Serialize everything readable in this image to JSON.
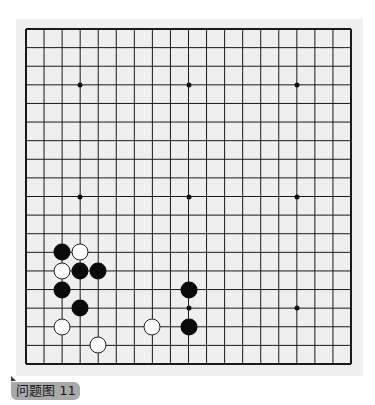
{
  "board": {
    "size": 19,
    "colors": {
      "line": "#1a1a1a",
      "background": "#efefef",
      "black": "#0a0a0a",
      "white": "#ffffff"
    },
    "star_points": [
      [
        3,
        3
      ],
      [
        9,
        3
      ],
      [
        15,
        3
      ],
      [
        3,
        9
      ],
      [
        9,
        9
      ],
      [
        15,
        9
      ],
      [
        3,
        15
      ],
      [
        9,
        15
      ],
      [
        15,
        15
      ]
    ],
    "stones": [
      {
        "color": "black",
        "col": 2,
        "row": 12
      },
      {
        "color": "white",
        "col": 3,
        "row": 12
      },
      {
        "color": "white",
        "col": 2,
        "row": 13
      },
      {
        "color": "black",
        "col": 3,
        "row": 13
      },
      {
        "color": "black",
        "col": 4,
        "row": 13
      },
      {
        "color": "black",
        "col": 2,
        "row": 14
      },
      {
        "color": "black",
        "col": 3,
        "row": 15
      },
      {
        "color": "white",
        "col": 2,
        "row": 16
      },
      {
        "color": "white",
        "col": 7,
        "row": 16
      },
      {
        "color": "white",
        "col": 4,
        "row": 17
      },
      {
        "color": "black",
        "col": 9,
        "row": 14
      },
      {
        "color": "black",
        "col": 9,
        "row": 16
      }
    ]
  },
  "caption": {
    "label": "问题图 11"
  }
}
